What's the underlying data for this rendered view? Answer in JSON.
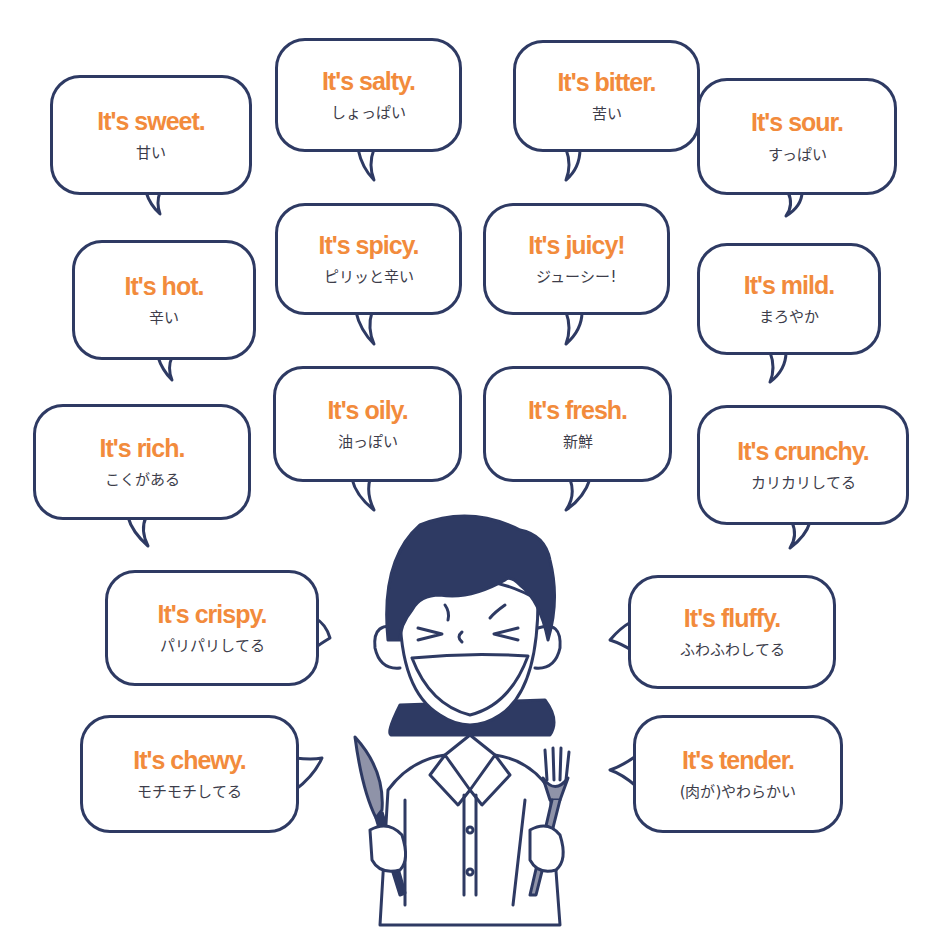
{
  "bubbles": [
    {
      "id": "sweet",
      "en": "It's sweet.",
      "jp": "甘い"
    },
    {
      "id": "salty",
      "en": "It's salty.",
      "jp": "しょっぱい"
    },
    {
      "id": "bitter",
      "en": "It's bitter.",
      "jp": "苦い"
    },
    {
      "id": "sour",
      "en": "It's sour.",
      "jp": "すっぱい"
    },
    {
      "id": "hot",
      "en": "It's hot.",
      "jp": "辛い"
    },
    {
      "id": "spicy",
      "en": "It's spicy.",
      "jp": "ピリッと辛い"
    },
    {
      "id": "juicy",
      "en": "It's juicy!",
      "jp": "ジューシー!"
    },
    {
      "id": "mild",
      "en": "It's mild.",
      "jp": "まろやか"
    },
    {
      "id": "rich",
      "en": "It's rich.",
      "jp": "こくがある"
    },
    {
      "id": "oily",
      "en": "It's oily.",
      "jp": "油っぽい"
    },
    {
      "id": "fresh",
      "en": "It's fresh.",
      "jp": "新鮮"
    },
    {
      "id": "crunchy",
      "en": "It's crunchy.",
      "jp": "カリカリしてる"
    },
    {
      "id": "crispy",
      "en": "It's crispy.",
      "jp": "パリパリしてる"
    },
    {
      "id": "fluffy",
      "en": "It's fluffy.",
      "jp": "ふわふわしてる"
    },
    {
      "id": "chewy",
      "en": "It's chewy.",
      "jp": "モチモチしてる"
    },
    {
      "id": "tender",
      "en": "It's tender.",
      "jp": "(肉が)やわらかい"
    }
  ],
  "colors": {
    "phrase": "#f28b3c",
    "outline": "#2e3a63",
    "japanese_text": "#3d3d4a",
    "background": "#ffffff"
  },
  "illustration": {
    "subject": "smiling person holding knife and fork",
    "icons": [
      "knife-icon",
      "fork-icon"
    ]
  }
}
